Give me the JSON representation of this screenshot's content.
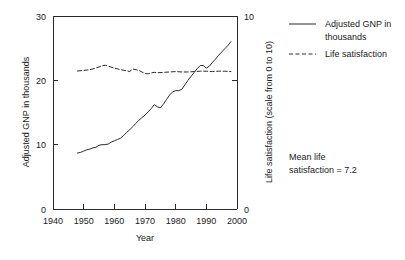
{
  "chart_data": {
    "type": "line",
    "title": "",
    "xlabel": "Year",
    "ylabel": "Adjusted GNP in thousands",
    "y2label": "Life satisfaction (scale from 0 to 10)",
    "xlim": [
      1940,
      2000
    ],
    "ylim": [
      0,
      30
    ],
    "y2lim": [
      0,
      10
    ],
    "xticks": [
      1940,
      1950,
      1960,
      1970,
      1980,
      1990,
      2000
    ],
    "xticklabels": [
      "1940",
      "1950",
      "1960",
      "1970",
      "1980",
      "1990",
      "2000"
    ],
    "yticks": [
      0,
      10,
      20,
      30
    ],
    "yticklabels": [
      "0",
      "10",
      "20",
      "30"
    ],
    "y2ticks": [
      0,
      10
    ],
    "y2ticklabels": [
      "0",
      "10"
    ],
    "grid": false,
    "legend_position": "right",
    "annotations": [
      {
        "text_line1": "Mean life",
        "text_line2": "satisfaction = 7.2",
        "value": 7.2
      }
    ],
    "series": [
      {
        "name": "Adjusted GNP in thousands",
        "style": "solid",
        "color": "#2b2b2b",
        "axis": "left",
        "x": [
          1948,
          1949,
          1950,
          1951,
          1952,
          1953,
          1954,
          1955,
          1956,
          1957,
          1958,
          1959,
          1960,
          1961,
          1962,
          1963,
          1964,
          1965,
          1966,
          1967,
          1968,
          1969,
          1970,
          1971,
          1972,
          1973,
          1974,
          1975,
          1976,
          1977,
          1978,
          1979,
          1980,
          1981,
          1982,
          1983,
          1984,
          1985,
          1986,
          1987,
          1988,
          1989,
          1990,
          1991,
          1992,
          1993,
          1994,
          1995,
          1996,
          1997,
          1998
        ],
        "values": [
          8.7,
          8.8,
          9.0,
          9.2,
          9.3,
          9.5,
          9.6,
          9.9,
          10.0,
          10.0,
          10.1,
          10.4,
          10.6,
          10.8,
          11.0,
          11.4,
          11.9,
          12.3,
          12.8,
          13.3,
          13.8,
          14.2,
          14.6,
          15.1,
          15.6,
          16.2,
          15.9,
          15.7,
          16.3,
          17.0,
          17.7,
          18.2,
          18.4,
          18.4,
          18.6,
          19.3,
          20.0,
          20.6,
          21.2,
          21.8,
          22.3,
          22.3,
          21.9,
          22.2,
          22.8,
          23.3,
          23.9,
          24.4,
          24.9,
          25.4,
          26.0
        ]
      },
      {
        "name": "Life satisfaction",
        "style": "dashed",
        "color": "#2b2b2b",
        "axis": "right",
        "x": [
          1948,
          1950,
          1952,
          1954,
          1956,
          1957,
          1958,
          1960,
          1962,
          1964,
          1965,
          1966,
          1968,
          1970,
          1971,
          1972,
          1973,
          1974,
          1976,
          1978,
          1980,
          1982,
          1984,
          1986,
          1988,
          1990,
          1992,
          1994,
          1996,
          1998
        ],
        "values": [
          7.15,
          7.18,
          7.22,
          7.3,
          7.42,
          7.45,
          7.4,
          7.3,
          7.22,
          7.16,
          7.12,
          7.26,
          7.18,
          7.02,
          7.0,
          7.05,
          7.08,
          7.06,
          7.08,
          7.1,
          7.12,
          7.1,
          7.1,
          7.12,
          7.14,
          7.14,
          7.12,
          7.14,
          7.14,
          7.12
        ]
      }
    ]
  },
  "legend": {
    "items": [
      {
        "label": "Adjusted GNP in",
        "label2": "thousands",
        "style": "solid"
      },
      {
        "label": "Life satisfaction",
        "label2": "",
        "style": "dashed"
      }
    ]
  }
}
